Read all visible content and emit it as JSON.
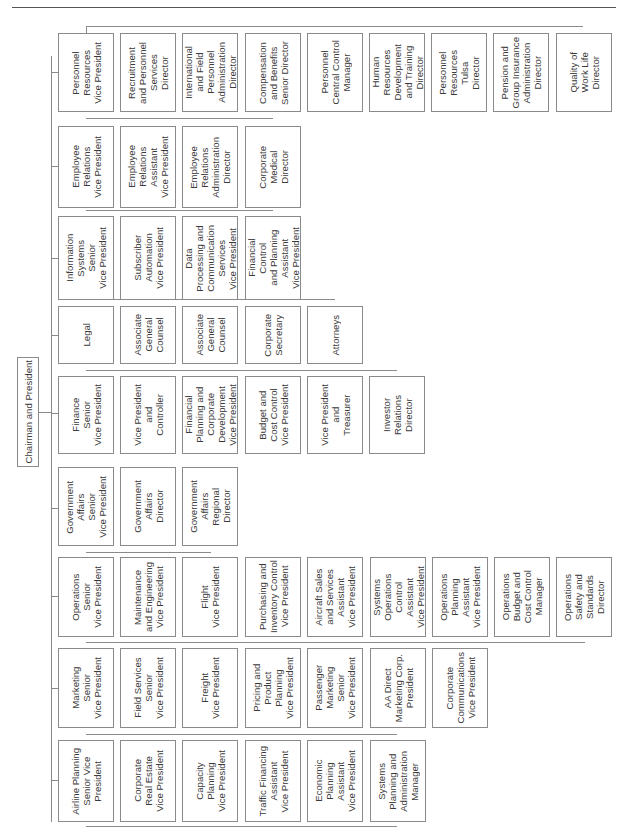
{
  "chart": {
    "root": "Chairman and President",
    "groups": [
      {
        "head": "Personnel\nResources\nVice President",
        "reports": [
          "Recruitment\nand Personnel\nServices\nDirector",
          "International\nand Field\nPersonnel\nAdministration\nDirector",
          "Compensation\nand Benefits\nSenior Director",
          "Personnel\nCentral Control\nManager",
          "Human\nResources\nDevelopment\nand Training\nDirector",
          "Personnel\nResources\nTulsa\nDirector",
          "Pension and\nGroup Insurance\nAdministration\nDirector",
          "Quality of\nWork Life\nDirector"
        ]
      },
      {
        "head": "Employee\nRelations\nVice President",
        "reports": [
          "Employee\nRelations\nAssistant\nVice President",
          "Employee\nRelations\nAdministration\nDirector",
          "Corporate\nMedical\nDirector"
        ]
      },
      {
        "head": "Information\nSystems\nSenior\nVice President",
        "reports": [
          "Subscriber\nAutomation\nVice President",
          "Data\nProcessing and\nCommunication\nServices\nVice President",
          "Financial\nControl\nand Planning\nAssistant\nVice President"
        ]
      },
      {
        "head": "Legal",
        "reports": [
          "Associate\nGeneral\nCounsel",
          "Associate\nGeneral\nCounsel",
          "Corporate\nSecretary",
          "Attorneys"
        ]
      },
      {
        "head": "Finance\nSenior\nVice President",
        "reports": [
          "Vice President\nand\nController",
          "Financial\nPlanning and\nCorporate\nDevelopment\nVice President",
          "Budget and\nCost Control\nVice President",
          "Vice President\nand\nTreasurer",
          "Investor\nRelations\nDirector"
        ]
      },
      {
        "head": "Government\nAffairs\nSenior\nVice President",
        "reports": [
          "Government\nAffairs\nDirector",
          "Government\nAffairs\nRegional\nDirector"
        ]
      },
      {
        "head": "Operations\nSenior\nVice President",
        "reports": [
          "Maintenance\nand Engineering\nVice President",
          "Flight\nVice President",
          "Purchasing and\nInventory Control\nVice President",
          "Aircraft Sales\nand Services\nAssistant\nVice President",
          "Systems\nOperations\nControl\nAssistant\nVice President",
          "Operations\nPlanning\nAssistant\nVice President",
          "Operations\nBudget and\nCost Control\nManager",
          "Operations\nSafety and\nStandards\nDirector"
        ]
      },
      {
        "head": "Marketing\nSenior\nVice President",
        "reports": [
          "Field Services\nSenior\nVice President",
          "Freight\nVice President",
          "Pricing and\nProduct\nPlanning\nVice President",
          "Passenger\nMarketing\nSenior\nVice President",
          "AA Direct\nMarketing Corp.\nPresident",
          "Corporate\nCommunications\nVice President"
        ]
      },
      {
        "head": "Airline Planning\nSenior Vice\nPresident",
        "reports": [
          "Corporate\nReal Estate\nVice President",
          "Capacity\nPlanning\nVice President",
          "Traffic Financing\nAssistant\nVice President",
          "Economic\nPlanning\nAssistant\nVice President",
          "Systems\nPlanning and\nAdministration\nManager"
        ]
      }
    ]
  }
}
